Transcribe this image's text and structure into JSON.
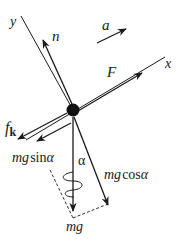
{
  "diagram": {
    "colors": {
      "ink": "#1a1a1a",
      "background": "#ffffff"
    },
    "axes": {
      "x_label": "x",
      "y_label": "y"
    },
    "forces": {
      "normal": "n",
      "acceleration": "a",
      "applied": "F",
      "friction_main": "f",
      "friction_sub": "k",
      "weight": "mg",
      "weight_parallel_prefix": "mg",
      "weight_parallel_fn": "sin",
      "weight_perp_prefix": "mg",
      "weight_perp_fn": "cos",
      "angle": "α"
    }
  }
}
